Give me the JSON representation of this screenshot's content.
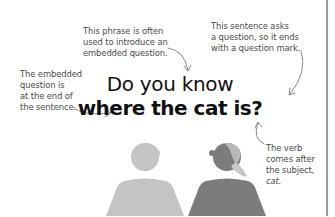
{
  "headline": {
    "line1": "Do you know",
    "line2": "where the cat is?"
  },
  "annotations": {
    "phrase_intro": {
      "lines": [
        "This phrase is often",
        "used to introduce an",
        "embedded question."
      ]
    },
    "question_mark": {
      "lines": [
        "This sentence asks",
        "a question, so it ends",
        "with a question mark."
      ]
    },
    "embedded_end": {
      "lines": [
        "The embedded",
        "question is",
        "at the end of",
        "the sentence."
      ]
    },
    "verb_after_subject": {
      "lines": [
        "The verb",
        "comes after",
        "the subject,"
      ],
      "italic_word": "cat."
    }
  },
  "figures": {
    "left_person": {
      "color": "#c4c4c4",
      "role": "speaker"
    },
    "right_person": {
      "color": "#7c7c7c",
      "hair_color": "#b8b8b8",
      "role": "listener"
    }
  },
  "colors": {
    "background": "#ffffff",
    "text": "#111111",
    "note_text": "#4a4a4a",
    "arrow": "#8a8a8a",
    "divider": "#9a9a9a"
  }
}
